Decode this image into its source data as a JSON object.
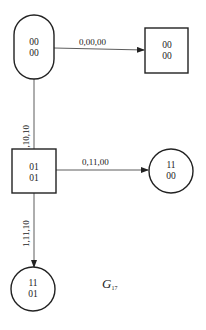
{
  "diagram": {
    "title": "G",
    "title_subscript": "17",
    "states": [
      {
        "id": "s0",
        "shape": "rounded",
        "line1": "00",
        "line2": "00"
      },
      {
        "id": "s1",
        "shape": "square",
        "line1": "00",
        "line2": "00"
      },
      {
        "id": "s2",
        "shape": "square",
        "line1": "01",
        "line2": "01"
      },
      {
        "id": "s3",
        "shape": "circle",
        "line1": "11",
        "line2": "00"
      },
      {
        "id": "s4",
        "shape": "circle",
        "line1": "11",
        "line2": "01"
      }
    ],
    "edges": [
      {
        "from": "s0",
        "to": "s1",
        "label": "0,00,00"
      },
      {
        "from": "s0",
        "to": "s2",
        "label": "1,10,10"
      },
      {
        "from": "s2",
        "to": "s3",
        "label": "0,11,00"
      },
      {
        "from": "s2",
        "to": "s4",
        "label": "1,11,10"
      }
    ]
  }
}
